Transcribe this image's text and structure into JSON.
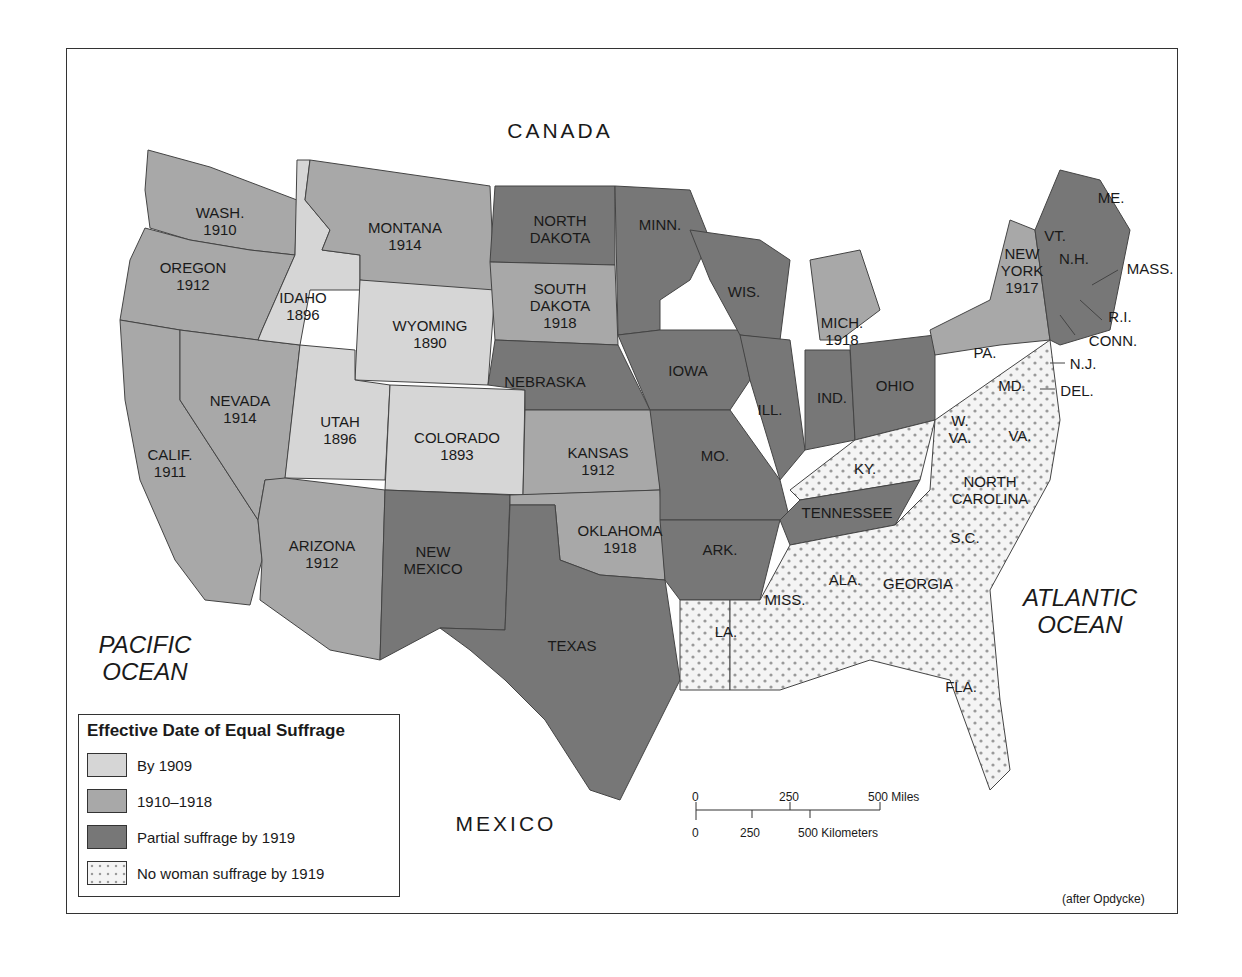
{
  "map": {
    "title": "Effective Date of Equal Suffrage",
    "credit": "(after Opdycke)",
    "colors": {
      "by_1909": "#d6d6d6",
      "1910_1918": "#a8a8a8",
      "partial_1919": "#777777",
      "none_1919": "#f2f2f2",
      "dot": "#9a9a9a",
      "border": "#444444"
    },
    "geo_labels": {
      "canada": "CANADA",
      "mexico": "MEXICO",
      "pacific_line1": "PACIFIC",
      "pacific_line2": "OCEAN",
      "atlantic_line1": "ATLANTIC",
      "atlantic_line2": "OCEAN"
    },
    "states": {
      "wash": {
        "name": "WASH.",
        "year": "1910",
        "category": "1910-1918"
      },
      "oregon": {
        "name": "OREGON",
        "year": "1912",
        "category": "1910-1918"
      },
      "calif": {
        "name": "CALIF.",
        "year": "1911",
        "category": "1910-1918"
      },
      "nevada": {
        "name": "NEVADA",
        "year": "1914",
        "category": "1910-1918"
      },
      "idaho": {
        "name": "IDAHO",
        "year": "1896",
        "category": "By 1909"
      },
      "montana": {
        "name": "MONTANA",
        "year": "1914",
        "category": "1910-1918"
      },
      "wyoming": {
        "name": "WYOMING",
        "year": "1890",
        "category": "By 1909"
      },
      "utah": {
        "name": "UTAH",
        "year": "1896",
        "category": "By 1909"
      },
      "colorado": {
        "name": "COLORADO",
        "year": "1893",
        "category": "By 1909"
      },
      "arizona": {
        "name": "ARIZONA",
        "year": "1912",
        "category": "1910-1918"
      },
      "new_mexico_1": "NEW",
      "new_mexico_2": "MEXICO",
      "north_dakota_1": "NORTH",
      "north_dakota_2": "DAKOTA",
      "south_dakota": {
        "name1": "SOUTH",
        "name2": "DAKOTA",
        "year": "1918",
        "category": "1910-1918"
      },
      "nebraska": {
        "name": "NEBRASKA",
        "category": "Partial"
      },
      "kansas": {
        "name": "KANSAS",
        "year": "1912",
        "category": "1910-1918"
      },
      "oklahoma": {
        "name": "OKLAHOMA",
        "year": "1918",
        "category": "1910-1918"
      },
      "texas": {
        "name": "TEXAS",
        "category": "Partial"
      },
      "minn": {
        "name": "MINN.",
        "category": "Partial"
      },
      "iowa": {
        "name": "IOWA",
        "category": "Partial"
      },
      "mo": {
        "name": "MO.",
        "category": "Partial"
      },
      "ark": {
        "name": "ARK.",
        "category": "Partial"
      },
      "la": {
        "name": "LA.",
        "category": "None"
      },
      "wis": {
        "name": "WIS.",
        "category": "Partial"
      },
      "ill": {
        "name": "ILL.",
        "category": "Partial"
      },
      "mich": {
        "name": "MICH.",
        "year": "1918",
        "category": "1910-1918"
      },
      "ind": {
        "name": "IND.",
        "category": "Partial"
      },
      "ohio": {
        "name": "OHIO",
        "category": "Partial"
      },
      "ky": {
        "name": "KY.",
        "category": "None"
      },
      "tennessee": {
        "name": "TENNESSEE",
        "category": "Partial"
      },
      "miss": {
        "name": "MISS.",
        "category": "None"
      },
      "ala": {
        "name": "ALA.",
        "category": "None"
      },
      "georgia": {
        "name": "GEORGIA",
        "category": "None"
      },
      "fla": {
        "name": "FLA.",
        "category": "None"
      },
      "sc": {
        "name": "S.C.",
        "category": "None"
      },
      "nc_1": "NORTH",
      "nc_2": "CAROLINA",
      "va": {
        "name": "VA.",
        "category": "None"
      },
      "wva_1": "W.",
      "wva_2": "VA.",
      "md": {
        "name": "MD.",
        "category": "None"
      },
      "del": {
        "name": "DEL.",
        "category": "None"
      },
      "nj": {
        "name": "N.J.",
        "category": "None"
      },
      "pa": {
        "name": "PA.",
        "category": "None"
      },
      "ny_1": "NEW",
      "ny_2": "YORK",
      "ny_year": "1917",
      "conn": {
        "name": "CONN.",
        "category": "Partial"
      },
      "ri": {
        "name": "R.I.",
        "category": "Partial"
      },
      "mass": {
        "name": "MASS.",
        "category": "Partial"
      },
      "nh": {
        "name": "N.H.",
        "category": "Partial"
      },
      "vt": {
        "name": "VT.",
        "category": "Partial"
      },
      "me": {
        "name": "ME.",
        "category": "Partial"
      }
    },
    "legend": [
      {
        "label": "By 1909",
        "swatch": "by_1909"
      },
      {
        "label": "1910–1918",
        "swatch": "1910_1918"
      },
      {
        "label": "Partial suffrage by 1919",
        "swatch": "partial_1919"
      },
      {
        "label": "No woman suffrage by 1919",
        "swatch": "none_1919"
      }
    ],
    "scale": {
      "miles": [
        "0",
        "250",
        "500 Miles"
      ],
      "km": [
        "0",
        "250",
        "500 Kilometers"
      ]
    }
  }
}
